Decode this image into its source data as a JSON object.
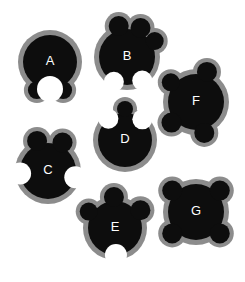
{
  "figure": {
    "title": "",
    "background_color": "#ffffff",
    "body_color": "#0d0d0d",
    "halo_color": "#8c8c8c",
    "notch_color": "#ffffff",
    "label_color": "#ffffff",
    "width": 245,
    "height": 282,
    "panel_labels": [
      "A",
      "B",
      "C",
      "D",
      "E",
      "F",
      "G"
    ],
    "shapes": [
      {
        "label": "A",
        "cx": 50,
        "cy": 62,
        "body_r": 27,
        "halo_r": 32,
        "lobes": [
          {
            "angle": 115,
            "r": 9
          },
          {
            "angle": 65,
            "r": 9
          }
        ],
        "notches": [
          {
            "angle": 90,
            "r": 13
          }
        ]
      },
      {
        "label": "B",
        "cx": 127,
        "cy": 57,
        "body_r": 28,
        "halo_r": 33,
        "lobes": [
          {
            "angle": 255,
            "r": 10
          },
          {
            "angle": 295,
            "r": 10
          },
          {
            "angle": 330,
            "r": 9
          }
        ],
        "notches": [
          {
            "angle": 57,
            "r": 10
          },
          {
            "angle": 118,
            "r": 10
          }
        ]
      },
      {
        "label": "C",
        "cx": 48,
        "cy": 171,
        "body_r": 28,
        "halo_r": 33,
        "lobes": [
          {
            "angle": 250,
            "r": 10
          },
          {
            "angle": 297,
            "r": 10
          }
        ],
        "notches": [
          {
            "angle": 175,
            "r": 11
          },
          {
            "angle": 13,
            "r": 11
          }
        ]
      },
      {
        "label": "D",
        "cx": 125,
        "cy": 140,
        "body_r": 27,
        "halo_r": 32,
        "lobes": [
          {
            "angle": 270,
            "r": 8
          }
        ],
        "notches": [
          {
            "angle": 232,
            "r": 10
          },
          {
            "angle": 310,
            "r": 10
          }
        ]
      },
      {
        "label": "E",
        "cx": 115,
        "cy": 228,
        "body_r": 27,
        "halo_r": 32,
        "lobes": [
          {
            "angle": 212,
            "r": 9
          },
          {
            "angle": 268,
            "r": 10
          },
          {
            "angle": 325,
            "r": 10
          }
        ],
        "notches": [
          {
            "angle": 88,
            "r": 11
          }
        ]
      },
      {
        "label": "F",
        "cx": 196,
        "cy": 102,
        "body_r": 28,
        "halo_r": 33,
        "lobes": [
          {
            "angle": 218,
            "r": 9
          },
          {
            "angle": 290,
            "r": 10
          },
          {
            "angle": 140,
            "r": 10
          },
          {
            "angle": 75,
            "r": 10
          }
        ],
        "notches": []
      },
      {
        "label": "G",
        "cx": 196,
        "cy": 212,
        "body_r": 28,
        "halo_r": 33,
        "lobes": [
          {
            "angle": 222,
            "r": 10
          },
          {
            "angle": 318,
            "r": 10
          },
          {
            "angle": 138,
            "r": 10
          },
          {
            "angle": 42,
            "r": 10
          }
        ],
        "notches": []
      }
    ]
  }
}
